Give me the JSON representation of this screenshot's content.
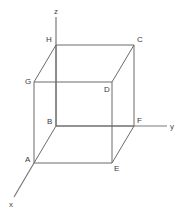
{
  "figure": {
    "stroke_color": "#6b6b6b",
    "axis_color": "#7a7a7a",
    "label_color": "#3a3a3a",
    "background_color": "#ffffff",
    "width": 188,
    "height": 218
  },
  "axes": [
    {
      "name": "x",
      "label": "x",
      "label_x": 9,
      "label_y": 201,
      "x1": 34,
      "y1": 163,
      "x2": 14,
      "y2": 197
    },
    {
      "name": "y",
      "label": "y",
      "label_x": 170,
      "label_y": 123,
      "x1": 56,
      "y1": 126,
      "x2": 167,
      "y2": 126
    },
    {
      "name": "z",
      "label": "z",
      "label_x": 54,
      "label_y": 8,
      "x1": 56,
      "y1": 17,
      "x2": 56,
      "y2": 126
    }
  ],
  "vertices": [
    {
      "name": "A",
      "label": "A",
      "x": 34,
      "y": 163,
      "label_x": 25,
      "label_y": 156
    },
    {
      "name": "B",
      "label": "B",
      "x": 56,
      "y": 126,
      "label_x": 47,
      "label_y": 118
    },
    {
      "name": "C",
      "label": "C",
      "x": 134,
      "y": 45,
      "label_x": 137,
      "label_y": 36
    },
    {
      "name": "D",
      "label": "D",
      "x": 112,
      "y": 82,
      "label_x": 104,
      "label_y": 86
    },
    {
      "name": "E",
      "label": "E",
      "x": 112,
      "y": 163,
      "label_x": 114,
      "label_y": 165
    },
    {
      "name": "F",
      "label": "F",
      "x": 134,
      "y": 126,
      "label_x": 137,
      "label_y": 117
    },
    {
      "name": "G",
      "label": "G",
      "x": 34,
      "y": 82,
      "label_x": 25,
      "label_y": 78
    },
    {
      "name": "H",
      "label": "H",
      "x": 56,
      "y": 45,
      "label_x": 46,
      "label_y": 36
    }
  ],
  "edges": [
    {
      "name": "edge-H-C",
      "from": "H",
      "to": "C",
      "x1": 56,
      "y1": 45,
      "x2": 134,
      "y2": 45
    },
    {
      "name": "edge-G-D",
      "from": "G",
      "to": "D",
      "x1": 34,
      "y1": 82,
      "x2": 112,
      "y2": 82
    },
    {
      "name": "edge-B-F",
      "from": "B",
      "to": "F",
      "x1": 56,
      "y1": 126,
      "x2": 134,
      "y2": 126
    },
    {
      "name": "edge-A-E",
      "from": "A",
      "to": "E",
      "x1": 34,
      "y1": 163,
      "x2": 112,
      "y2": 163
    },
    {
      "name": "edge-G-A",
      "from": "G",
      "to": "A",
      "x1": 34,
      "y1": 82,
      "x2": 34,
      "y2": 163
    },
    {
      "name": "edge-H-B",
      "from": "H",
      "to": "B",
      "x1": 56,
      "y1": 45,
      "x2": 56,
      "y2": 126
    },
    {
      "name": "edge-D-E",
      "from": "D",
      "to": "E",
      "x1": 112,
      "y1": 82,
      "x2": 112,
      "y2": 163
    },
    {
      "name": "edge-C-F",
      "from": "C",
      "to": "F",
      "x1": 134,
      "y1": 45,
      "x2": 134,
      "y2": 126
    },
    {
      "name": "edge-H-G",
      "from": "H",
      "to": "G",
      "x1": 56,
      "y1": 45,
      "x2": 34,
      "y2": 82
    },
    {
      "name": "edge-C-D",
      "from": "C",
      "to": "D",
      "x1": 134,
      "y1": 45,
      "x2": 112,
      "y2": 82
    },
    {
      "name": "edge-B-A",
      "from": "B",
      "to": "A",
      "x1": 56,
      "y1": 126,
      "x2": 34,
      "y2": 163
    },
    {
      "name": "edge-F-E",
      "from": "F",
      "to": "E",
      "x1": 134,
      "y1": 126,
      "x2": 112,
      "y2": 163
    }
  ]
}
